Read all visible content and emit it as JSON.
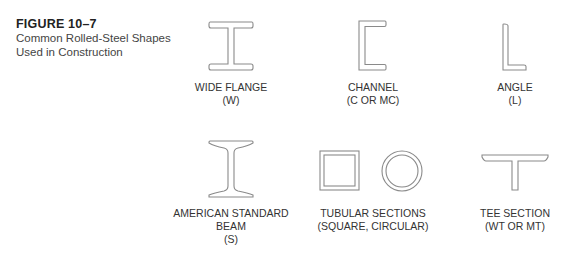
{
  "figure": {
    "number": "FIGURE 10–7",
    "title_line1": "Common Rolled-Steel Shapes",
    "title_line2": "Used in Construction"
  },
  "shapes": [
    {
      "id": "wide-flange",
      "icon": "wide-flange-icon",
      "lines": [
        "WIDE FLANGE",
        "(W)"
      ]
    },
    {
      "id": "channel",
      "icon": "channel-icon",
      "lines": [
        "CHANNEL",
        "(C OR MC)"
      ]
    },
    {
      "id": "angle",
      "icon": "angle-icon",
      "lines": [
        "ANGLE",
        "(L)"
      ]
    },
    {
      "id": "american-standard-beam",
      "icon": "s-beam-icon",
      "lines": [
        "AMERICAN STANDARD",
        "BEAM",
        "(S)"
      ]
    },
    {
      "id": "tubular-sections",
      "icon": "tube-icons",
      "lines": [
        "TUBULAR SECTIONS",
        "(SQUARE, CIRCULAR)"
      ]
    },
    {
      "id": "tee-section",
      "icon": "tee-icon",
      "lines": [
        "TEE SECTION",
        "(WT OR MT)"
      ]
    }
  ]
}
